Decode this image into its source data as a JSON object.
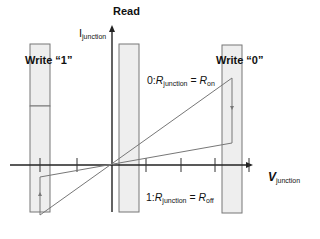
{
  "diagram": {
    "read_label": "Read",
    "y_axis": {
      "symbol": "I",
      "subscript": "junction"
    },
    "x_axis": {
      "symbol": "V",
      "subscript": "junction"
    },
    "write1_label": "Write “1”",
    "write0_label": "Write “0”",
    "state0": {
      "prefix": "0:",
      "R": "R",
      "sub": "junction",
      "eq": " = ",
      "R2": "R",
      "sub2": "on"
    },
    "state1": {
      "prefix": "1:",
      "R": "R",
      "sub": "junction",
      "eq": " = ",
      "R2": "R",
      "sub2": "off"
    },
    "colors": {
      "band_fill": "#eeeeee",
      "band_stroke": "#777777",
      "axis": "#222222",
      "curve": "#777777"
    }
  }
}
